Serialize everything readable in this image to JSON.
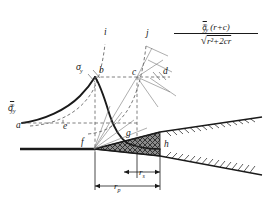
{
  "figure": {
    "name": "crack-tip-stress-distribution",
    "type": "technical-diagram",
    "background": "#ffffff",
    "line_color": "#1a1a1a",
    "hatch_fill": "#6e6e6e"
  },
  "formula": {
    "numerator": "σⁿᵧᵧ(r+c)",
    "numerator_sigma": "σ",
    "numerator_sub": "yy",
    "numerator_sup": "∞",
    "numerator_rest": "(r+c)",
    "denominator_radical": "√",
    "denominator_body": "r²+2cr",
    "full_text": "σ∞yy(r+c) / √(r²+2cr)"
  },
  "axis_labels": {
    "sigma_infinity_yy": {
      "sigma": "σ",
      "sub": "yy",
      "sup": "∞"
    },
    "sigma_y": {
      "sigma": "σ",
      "sub": "y"
    }
  },
  "curve_labels": [
    {
      "id": "i",
      "text": "i"
    },
    {
      "id": "j",
      "text": "j"
    }
  ],
  "points": [
    {
      "id": "a",
      "text": "a",
      "x": 16,
      "y": 121
    },
    {
      "id": "b",
      "text": "b",
      "x": 99,
      "y": 76
    },
    {
      "id": "c",
      "text": "c",
      "x": 133,
      "y": 79
    },
    {
      "id": "d",
      "text": "d",
      "x": 163,
      "y": 78
    },
    {
      "id": "e",
      "text": "e",
      "x": 63,
      "y": 122
    },
    {
      "id": "f",
      "text": "f",
      "x": 79,
      "y": 145
    },
    {
      "id": "g",
      "text": "g",
      "x": 127,
      "y": 138
    },
    {
      "id": "h",
      "text": "h",
      "x": 164,
      "y": 147
    }
  ],
  "dimensions": [
    {
      "id": "r_s",
      "symbol": "r",
      "sub": "s",
      "label": "rs",
      "span": "inner"
    },
    {
      "id": "r_p",
      "symbol": "r",
      "sub": "p",
      "label": "rp",
      "span": "outer"
    }
  ],
  "geometry": {
    "baseline_y": 149,
    "crack_tip_x": 94,
    "plastic_zone_right_x": 160,
    "wedge_apex_x": 94
  }
}
